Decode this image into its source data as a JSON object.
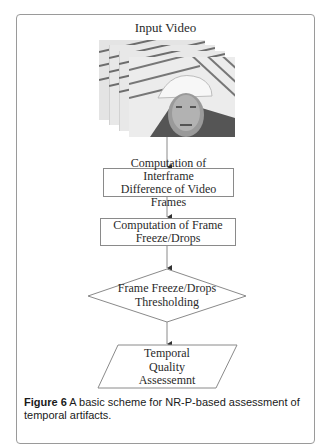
{
  "figure": {
    "input_label": "Input Video",
    "steps": [
      {
        "id": "interframe",
        "shape": "rectangle",
        "lines": [
          "Computation of Interframe",
          "Difference  of Video Frames"
        ]
      },
      {
        "id": "freeze",
        "shape": "rectangle",
        "lines": [
          "Computation of  Frame",
          "Freeze/Drops"
        ]
      },
      {
        "id": "threshold",
        "shape": "diamond",
        "lines": [
          "Frame Freeze/Drops",
          "Thresholding"
        ]
      },
      {
        "id": "assessment",
        "shape": "parallelogram",
        "lines": [
          "Temporal",
          "Quality",
          "Assessemnt"
        ]
      }
    ],
    "caption": {
      "label": "Figure 6",
      "text": " A basic scheme for NR-P-based assessment of temporal artifacts."
    }
  },
  "colors": {
    "line": "#8a8a8a",
    "text": "#2a2a2a",
    "frame_border": "#9a9a9a"
  }
}
